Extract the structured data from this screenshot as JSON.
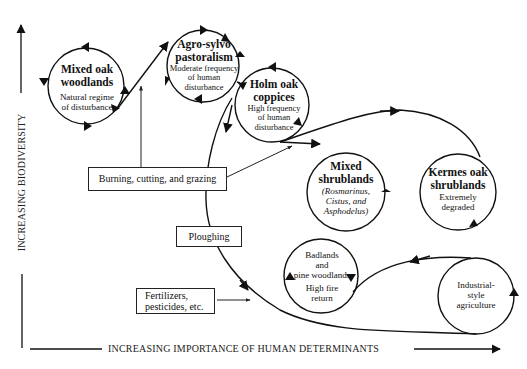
{
  "axes": {
    "x_label": "INCREASING IMPORTANCE OF HUMAN DETERMINANTS",
    "y_label": "INCREASING BIODIVERSITY"
  },
  "nodes": [
    {
      "id": "mixed-oak-woodlands",
      "title": "Mixed oak woodlands",
      "title_lines": [
        "Mixed oak",
        "woodlands"
      ],
      "sub_lines": [
        "Natural regime",
        "of disturbance"
      ]
    },
    {
      "id": "agro-sylvo-pastoralism",
      "title": "Agro-sylvo pastoralism",
      "title_lines": [
        "Agro-sylvo",
        "pastoralism"
      ],
      "sub_lines": [
        "Moderate frequency",
        "of human",
        "disturbance"
      ]
    },
    {
      "id": "holm-oak-coppices",
      "title": "Holm oak coppices",
      "title_lines": [
        "Holm oak",
        "coppices"
      ],
      "sub_lines": [
        "High frequency",
        "of human",
        "disturbance"
      ]
    },
    {
      "id": "mixed-shrublands",
      "title": "Mixed shrublands",
      "title_lines": [
        "Mixed",
        "shrublands"
      ],
      "sub_lines": [
        "(Rosmarinus,",
        "Cistus, and",
        "Asphodelus)"
      ]
    },
    {
      "id": "kermes-oak-shrublands",
      "title": "Kermes oak shrublands",
      "title_lines": [
        "Kermes oak",
        "shrublands"
      ],
      "sub_lines": [
        "Extremely",
        "degraded"
      ]
    },
    {
      "id": "badlands-pine-woodlands",
      "title": "",
      "title_lines": [],
      "sub_lines": [
        "Badlands",
        "and",
        "pine woodlands",
        "High fire",
        "return"
      ]
    },
    {
      "id": "industrial-agriculture",
      "title": "",
      "title_lines": [],
      "sub_lines": [
        "Industrial-",
        "style",
        "agriculture"
      ]
    }
  ],
  "drivers": [
    {
      "id": "burning-cutting-grazing",
      "label": "Burning, cutting, and grazing"
    },
    {
      "id": "ploughing",
      "label": "Ploughing"
    },
    {
      "id": "fertilizers-pesticides",
      "label_lines": [
        "Fertilizers,",
        "pesticides, etc."
      ]
    }
  ]
}
